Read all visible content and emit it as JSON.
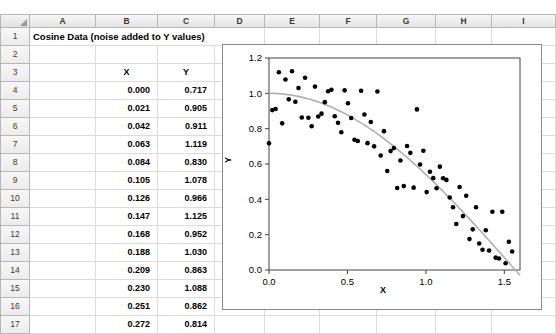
{
  "spreadsheet": {
    "columns": [
      "A",
      "B",
      "C",
      "D",
      "E",
      "F",
      "G",
      "H",
      "I"
    ],
    "rows": [
      "1",
      "2",
      "3",
      "4",
      "5",
      "6",
      "7",
      "8",
      "9",
      "10",
      "11",
      "12",
      "13",
      "14",
      "15",
      "16",
      "17"
    ],
    "title": "Cosine Data (noise added to Y values)",
    "header_x": "X",
    "header_y": "Y",
    "data": [
      {
        "row": "4",
        "x": "0.000",
        "y": "0.717"
      },
      {
        "row": "5",
        "x": "0.021",
        "y": "0.905"
      },
      {
        "row": "6",
        "x": "0.042",
        "y": "0.911"
      },
      {
        "row": "7",
        "x": "0.063",
        "y": "1.119"
      },
      {
        "row": "8",
        "x": "0.084",
        "y": "0.830"
      },
      {
        "row": "9",
        "x": "0.105",
        "y": "1.078"
      },
      {
        "row": "10",
        "x": "0.126",
        "y": "0.966"
      },
      {
        "row": "11",
        "x": "0.147",
        "y": "1.125"
      },
      {
        "row": "12",
        "x": "0.168",
        "y": "0.952"
      },
      {
        "row": "13",
        "x": "0.188",
        "y": "1.030"
      },
      {
        "row": "14",
        "x": "0.209",
        "y": "0.863"
      },
      {
        "row": "15",
        "x": "0.230",
        "y": "1.088"
      },
      {
        "row": "16",
        "x": "0.251",
        "y": "0.862"
      },
      {
        "row": "17",
        "x": "0.272",
        "y": "0.814"
      }
    ]
  },
  "chart_data": {
    "type": "scatter",
    "title": "",
    "xlabel": "X",
    "ylabel": "Y",
    "xlim": [
      0.0,
      1.6
    ],
    "ylim": [
      0.0,
      1.2
    ],
    "xticks": [
      "0.0",
      "0.5",
      "1.0",
      "1.5"
    ],
    "yticks": [
      "0.0",
      "0.2",
      "0.4",
      "0.6",
      "0.8",
      "1.0",
      "1.2"
    ],
    "grid": false,
    "legend": "none",
    "marker_color": "#000000",
    "trendline_color": "#b0b0b0",
    "trendline_label": "cosine fit",
    "points": [
      [
        0.0,
        0.717
      ],
      [
        0.021,
        0.905
      ],
      [
        0.042,
        0.911
      ],
      [
        0.063,
        1.119
      ],
      [
        0.084,
        0.83
      ],
      [
        0.105,
        1.078
      ],
      [
        0.126,
        0.966
      ],
      [
        0.147,
        1.125
      ],
      [
        0.168,
        0.952
      ],
      [
        0.188,
        1.03
      ],
      [
        0.209,
        0.863
      ],
      [
        0.23,
        1.088
      ],
      [
        0.251,
        0.862
      ],
      [
        0.272,
        0.814
      ],
      [
        0.293,
        1.038
      ],
      [
        0.314,
        0.869
      ],
      [
        0.335,
        0.885
      ],
      [
        0.356,
        0.95
      ],
      [
        0.377,
        1.012
      ],
      [
        0.398,
        1.02
      ],
      [
        0.419,
        0.87
      ],
      [
        0.44,
        0.833
      ],
      [
        0.461,
        0.78
      ],
      [
        0.482,
        1.017
      ],
      [
        0.503,
        0.944
      ],
      [
        0.524,
        0.86
      ],
      [
        0.545,
        0.737
      ],
      [
        0.566,
        0.73
      ],
      [
        0.587,
        1.015
      ],
      [
        0.608,
        0.88
      ],
      [
        0.628,
        0.718
      ],
      [
        0.649,
        0.838
      ],
      [
        0.67,
        0.7
      ],
      [
        0.691,
        1.01
      ],
      [
        0.712,
        0.648
      ],
      [
        0.733,
        0.786
      ],
      [
        0.754,
        0.56
      ],
      [
        0.775,
        0.673
      ],
      [
        0.796,
        0.69
      ],
      [
        0.817,
        0.464
      ],
      [
        0.838,
        0.62
      ],
      [
        0.859,
        0.475
      ],
      [
        0.88,
        0.702
      ],
      [
        0.901,
        0.663
      ],
      [
        0.922,
        0.466
      ],
      [
        0.943,
        0.909
      ],
      [
        0.963,
        0.597
      ],
      [
        0.984,
        0.675
      ],
      [
        1.005,
        0.441
      ],
      [
        1.026,
        0.556
      ],
      [
        1.047,
        0.52
      ],
      [
        1.068,
        0.463
      ],
      [
        1.089,
        0.585
      ],
      [
        1.11,
        0.519
      ],
      [
        1.131,
        0.51
      ],
      [
        1.152,
        0.41
      ],
      [
        1.173,
        0.355
      ],
      [
        1.194,
        0.26
      ],
      [
        1.215,
        0.47
      ],
      [
        1.236,
        0.305
      ],
      [
        1.257,
        0.42
      ],
      [
        1.278,
        0.175
      ],
      [
        1.299,
        0.23
      ],
      [
        1.32,
        0.355
      ],
      [
        1.34,
        0.15
      ],
      [
        1.361,
        0.115
      ],
      [
        1.382,
        0.225
      ],
      [
        1.403,
        0.11
      ],
      [
        1.424,
        0.33
      ],
      [
        1.445,
        0.07
      ],
      [
        1.466,
        0.065
      ],
      [
        1.487,
        0.33
      ],
      [
        1.508,
        0.038
      ],
      [
        1.529,
        0.16
      ],
      [
        1.55,
        0.105
      ]
    ]
  }
}
